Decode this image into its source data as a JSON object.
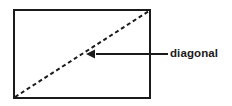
{
  "figure": {
    "kind": "geometry-diagram",
    "background_color": "#ffffff",
    "stroke_color": "#1a1a1a",
    "shape": {
      "name": "rectangle",
      "outline_style": "solid",
      "stroke_width_px": 2,
      "fill": "#ffffff",
      "left_px": 14,
      "top_px": 10,
      "right_px": 150,
      "bottom_px": 98,
      "width_px": 136,
      "height_px": 88
    },
    "diagonal": {
      "name": "diagonal",
      "line_style": "dashed",
      "stroke_width_px": 2,
      "dash_length_px": 4,
      "dash_gap_px": 3,
      "from_corner": "bottom-left",
      "to_corner": "top-right",
      "x1_px": 15,
      "y1_px": 97,
      "x2_px": 149,
      "y2_px": 11
    },
    "callout": {
      "label": "diagonal",
      "label_weight": "bold",
      "label_x_px": 170,
      "label_y_px": 54,
      "leader_line": {
        "name": "leader-line",
        "style": "solid",
        "stroke_width_px": 2,
        "from_x_px": 168,
        "from_y_px": 54,
        "to_x_px": 86,
        "to_y_px": 54,
        "arrowhead_at": "left-end",
        "arrowhead_length_px": 9,
        "arrowhead_half_width_px": 4.5
      }
    }
  }
}
